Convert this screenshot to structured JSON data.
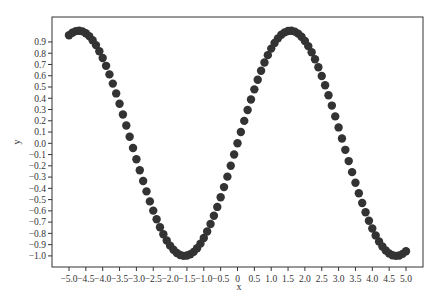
{
  "chart_data": {
    "type": "scatter",
    "title": "",
    "xlabel": "x",
    "ylabel": "y",
    "xlim": [
      -5.5,
      5.5
    ],
    "ylim": [
      -1.1,
      1.1
    ],
    "grid": false,
    "legend": null,
    "marker_color": "#333333",
    "x_ticks": [
      -5.0,
      -4.5,
      -4.0,
      -3.5,
      -3.0,
      -2.5,
      -2.0,
      -1.5,
      -1.0,
      -0.5,
      0,
      0.5,
      1.0,
      1.5,
      2.0,
      2.5,
      3.0,
      3.5,
      4.0,
      4.5,
      5.0
    ],
    "x_tick_labels": [
      "−5.0",
      "−4.5",
      "−4.0",
      "−3.5",
      "−3.0",
      "−2.5",
      "−2.0",
      "−1.5",
      "−1.0",
      "−0.5",
      "0",
      "0.5",
      "1.0",
      "1.5",
      "2.0",
      "2.5",
      "3.0",
      "3.5",
      "4.0",
      "4.5",
      "5.0"
    ],
    "y_ticks": [
      0.9,
      0.8,
      0.7,
      0.6,
      0.5,
      0.4,
      0.3,
      0.2,
      0.1,
      0.0,
      -0.1,
      -0.2,
      -0.3,
      -0.4,
      -0.5,
      -0.6,
      -0.7,
      -0.8,
      -0.9,
      -1.0
    ],
    "y_tick_labels": [
      "0.9",
      "0.8",
      "0.7",
      "0.6",
      "0.5",
      "0.4",
      "0.3",
      "0.2",
      "0.1",
      "0.0",
      "−0.1",
      "−0.2",
      "−0.3",
      "−0.4",
      "−0.5",
      "−0.6",
      "−0.7",
      "−0.8",
      "−0.9",
      "−1.0"
    ],
    "series": [
      {
        "name": "sin(x)",
        "x": [
          -5.0,
          -4.9,
          -4.8,
          -4.7,
          -4.6,
          -4.5,
          -4.4,
          -4.3,
          -4.2,
          -4.1,
          -4.0,
          -3.9,
          -3.8,
          -3.7,
          -3.6,
          -3.5,
          -3.4,
          -3.3,
          -3.2,
          -3.1,
          -3.0,
          -2.9,
          -2.8,
          -2.7,
          -2.6,
          -2.5,
          -2.4,
          -2.3,
          -2.2,
          -2.1,
          -2.0,
          -1.9,
          -1.8,
          -1.7,
          -1.6,
          -1.5,
          -1.4,
          -1.3,
          -1.2,
          -1.1,
          -1.0,
          -0.9,
          -0.8,
          -0.7,
          -0.6,
          -0.5,
          -0.4,
          -0.3,
          -0.2,
          -0.1,
          0.0,
          0.1,
          0.2,
          0.3,
          0.4,
          0.5,
          0.6,
          0.7,
          0.8,
          0.9,
          1.0,
          1.1,
          1.2,
          1.3,
          1.4,
          1.5,
          1.6,
          1.7,
          1.8,
          1.9,
          2.0,
          2.1,
          2.2,
          2.3,
          2.4,
          2.5,
          2.6,
          2.7,
          2.8,
          2.9,
          3.0,
          3.1,
          3.2,
          3.3,
          3.4,
          3.5,
          3.6,
          3.7,
          3.8,
          3.9,
          4.0,
          4.1,
          4.2,
          4.3,
          4.4,
          4.5,
          4.6,
          4.7,
          4.8,
          4.9,
          5.0
        ],
        "y": [
          0.959,
          0.982,
          0.996,
          1.0,
          0.994,
          0.978,
          0.952,
          0.916,
          0.872,
          0.818,
          0.757,
          0.688,
          0.612,
          0.53,
          0.443,
          0.351,
          0.256,
          0.158,
          0.058,
          -0.042,
          -0.141,
          -0.239,
          -0.335,
          -0.427,
          -0.516,
          -0.598,
          -0.675,
          -0.746,
          -0.808,
          -0.863,
          -0.909,
          -0.946,
          -0.974,
          -0.992,
          -1.0,
          -0.997,
          -0.985,
          -0.964,
          -0.932,
          -0.891,
          -0.841,
          -0.783,
          -0.717,
          -0.644,
          -0.565,
          -0.479,
          -0.389,
          -0.296,
          -0.199,
          -0.1,
          0.0,
          0.1,
          0.199,
          0.296,
          0.389,
          0.479,
          0.565,
          0.644,
          0.717,
          0.783,
          0.841,
          0.891,
          0.932,
          0.964,
          0.985,
          0.997,
          1.0,
          0.992,
          0.974,
          0.946,
          0.909,
          0.863,
          0.808,
          0.746,
          0.675,
          0.598,
          0.516,
          0.427,
          0.335,
          0.239,
          0.141,
          0.042,
          -0.058,
          -0.158,
          -0.256,
          -0.351,
          -0.443,
          -0.53,
          -0.612,
          -0.688,
          -0.757,
          -0.818,
          -0.872,
          -0.916,
          -0.952,
          -0.978,
          -0.994,
          -1.0,
          -0.996,
          -0.982,
          -0.959
        ]
      }
    ]
  }
}
